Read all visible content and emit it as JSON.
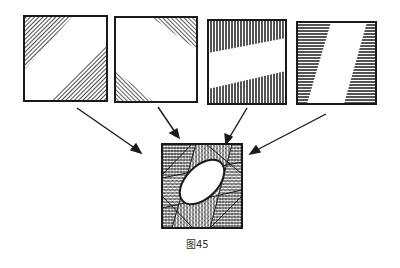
{
  "figure": {
    "caption": "图45",
    "panels": [
      {
        "id": "panel-1",
        "description": "square with diagonal hatched triangles at top-left and bottom-right corners (diagonal band white)"
      },
      {
        "id": "panel-2",
        "description": "square with small hatched triangles at top-right and bottom-left corners"
      },
      {
        "id": "panel-3",
        "description": "square with vertical-hatched bands top and bottom, slanted white band across middle"
      },
      {
        "id": "panel-4",
        "description": "square with horizontal-hatched sides, slanted white parallelogram in the middle"
      }
    ],
    "result": {
      "id": "combined",
      "description": "overlaid square with cross-hatching and white tilted ellipse in center"
    },
    "arrows": 4
  },
  "colors": {
    "ink": "#1a1a1a",
    "paper": "#ffffff"
  }
}
